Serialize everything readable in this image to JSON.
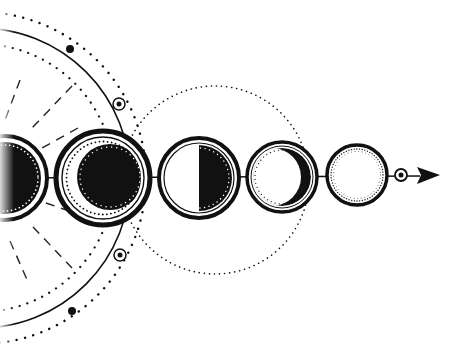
{
  "illustration": {
    "title": "Moon phases progression",
    "colors": {
      "ink": "#111111",
      "paper": "#ffffff",
      "fade": "#e6e6e6"
    },
    "orbit": {
      "center": [
        -20,
        178
      ],
      "solid_radius": 150,
      "outer_dotted_radius": 166,
      "inner_dotted_radius": 134,
      "markers": [
        {
          "type": "dot",
          "position": [
            70,
            49
          ]
        },
        {
          "type": "ringed-dot",
          "position": [
            119,
            104
          ]
        },
        {
          "type": "ringed-dot",
          "position": [
            120,
            255
          ]
        },
        {
          "type": "dot",
          "position": [
            72,
            311
          ]
        }
      ],
      "dashed_rays": 5
    },
    "guide_circle": {
      "center": [
        215,
        180
      ],
      "radius": 94
    },
    "axis": {
      "y": 178,
      "x_start": 0,
      "x_end": 440
    },
    "phases": [
      {
        "name": "new-moon",
        "cx": 5,
        "cy": 178,
        "r": 42
      },
      {
        "name": "waxing-crescent-dark",
        "cx": 103,
        "cy": 178,
        "r": 47
      },
      {
        "name": "half-moon",
        "cx": 199,
        "cy": 178,
        "r": 40
      },
      {
        "name": "waning-crescent",
        "cx": 282,
        "cy": 177,
        "r": 35
      },
      {
        "name": "full-moon",
        "cx": 357,
        "cy": 175,
        "r": 30
      }
    ],
    "end_marker": {
      "type": "ringed-dot",
      "position": [
        401,
        175
      ]
    },
    "arrow": {
      "tip": [
        440,
        175
      ],
      "base_x": 417
    }
  }
}
